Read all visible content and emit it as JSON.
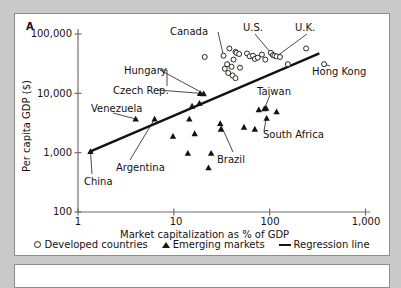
{
  "figure": {
    "panel_letter": "A",
    "panel_b_empty": true
  },
  "chart_data": {
    "type": "scatter",
    "title": "",
    "xlabel": "Market capitalization as % of GDP",
    "ylabel": "Per capita GDP ($)",
    "xscale": "log",
    "yscale": "log",
    "xlim": [
      1,
      1000
    ],
    "ylim": [
      100,
      100000
    ],
    "xticks": [
      1,
      10,
      100,
      1000
    ],
    "xticklabels": [
      "1",
      "10",
      "100",
      "1,000"
    ],
    "yticks": [
      100,
      1000,
      10000,
      100000
    ],
    "yticklabels": [
      "100",
      "1,000",
      "10,000",
      "100,000"
    ],
    "grid": false,
    "legend_position": "below-axis",
    "legend": [
      {
        "marker": "open-circle",
        "label": "Developed countries"
      },
      {
        "marker": "filled-triangle",
        "label": "Emerging markets"
      },
      {
        "marker": "line",
        "label": "Regression line"
      }
    ],
    "series": [
      {
        "name": "Developed countries",
        "marker": "open-circle",
        "points": [
          {
            "x": 21,
            "y": 41000
          },
          {
            "x": 38,
            "y": 57000
          },
          {
            "x": 44,
            "y": 50000
          },
          {
            "x": 45,
            "y": 48000
          },
          {
            "x": 48,
            "y": 46000
          },
          {
            "x": 33,
            "y": 43000
          },
          {
            "x": 42,
            "y": 37000
          },
          {
            "x": 58,
            "y": 47000
          },
          {
            "x": 62,
            "y": 42000
          },
          {
            "x": 67,
            "y": 43000
          },
          {
            "x": 70,
            "y": 38000
          },
          {
            "x": 75,
            "y": 40000
          },
          {
            "x": 83,
            "y": 45000
          },
          {
            "x": 90,
            "y": 37000
          },
          {
            "x": 103,
            "y": 48000
          },
          {
            "x": 108,
            "y": 44000
          },
          {
            "x": 112,
            "y": 43000
          },
          {
            "x": 118,
            "y": 42000
          },
          {
            "x": 128,
            "y": 41000
          },
          {
            "x": 36,
            "y": 31000
          },
          {
            "x": 40,
            "y": 28000
          },
          {
            "x": 34,
            "y": 26000
          },
          {
            "x": 49,
            "y": 27000
          },
          {
            "x": 37,
            "y": 22000
          },
          {
            "x": 41,
            "y": 20000
          },
          {
            "x": 44,
            "y": 18000
          },
          {
            "x": 240,
            "y": 57000
          },
          {
            "x": 155,
            "y": 31000
          },
          {
            "x": 370,
            "y": 31000
          }
        ]
      },
      {
        "name": "Emerging markets",
        "marker": "filled-triangle",
        "points": [
          {
            "x": 1.35,
            "y": 1050
          },
          {
            "x": 4.0,
            "y": 3700
          },
          {
            "x": 6.3,
            "y": 3700
          },
          {
            "x": 9.8,
            "y": 1900
          },
          {
            "x": 14.5,
            "y": 3700
          },
          {
            "x": 15.5,
            "y": 6100
          },
          {
            "x": 18.5,
            "y": 6800
          },
          {
            "x": 18.8,
            "y": 10000
          },
          {
            "x": 20.5,
            "y": 9900
          },
          {
            "x": 14.0,
            "y": 980
          },
          {
            "x": 16.5,
            "y": 2100
          },
          {
            "x": 23.0,
            "y": 560
          },
          {
            "x": 24.5,
            "y": 980
          },
          {
            "x": 30.5,
            "y": 3100
          },
          {
            "x": 31.0,
            "y": 2500
          },
          {
            "x": 54.0,
            "y": 2700
          },
          {
            "x": 70.0,
            "y": 2500
          },
          {
            "x": 77.0,
            "y": 5300
          },
          {
            "x": 88.0,
            "y": 5500
          },
          {
            "x": 92.0,
            "y": 5600
          },
          {
            "x": 93.0,
            "y": 3800
          },
          {
            "x": 118.0,
            "y": 4900
          }
        ]
      }
    ],
    "regression_line": {
      "label": "Regression line",
      "from": {
        "x": 1.35,
        "y": 1050
      },
      "to": {
        "x": 330,
        "y": 47000
      }
    },
    "annotations": [
      {
        "label": "Canada",
        "target": {
          "x": 33,
          "y": 43000
        }
      },
      {
        "label": "U.S.",
        "target": {
          "x": 103,
          "y": 48000
        }
      },
      {
        "label": "U.K.",
        "target": {
          "x": 118,
          "y": 42000
        }
      },
      {
        "label": "Hong Kong",
        "target": {
          "x": 370,
          "y": 31000
        }
      },
      {
        "label": "Hungary",
        "target": {
          "x": 20.5,
          "y": 9900
        }
      },
      {
        "label": "Czech Rep.",
        "target": {
          "x": 18.8,
          "y": 10000
        }
      },
      {
        "label": "Venezuela",
        "target": {
          "x": 4.0,
          "y": 3700
        }
      },
      {
        "label": "Argentina",
        "target": {
          "x": 6.3,
          "y": 3700
        }
      },
      {
        "label": "China",
        "target": {
          "x": 1.35,
          "y": 1050
        }
      },
      {
        "label": "Taiwan",
        "target": {
          "x": 88,
          "y": 5500
        }
      },
      {
        "label": "South Africa",
        "target": {
          "x": 92,
          "y": 3800
        }
      },
      {
        "label": "Brazil",
        "target": {
          "x": 30.5,
          "y": 3100
        }
      }
    ]
  }
}
